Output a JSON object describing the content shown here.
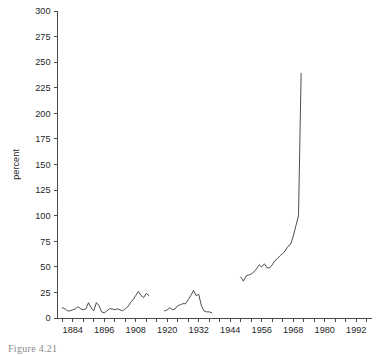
{
  "figure": {
    "caption": "Figure 4.21",
    "ylabel": "percent"
  },
  "chart_data": {
    "type": "line",
    "title": "",
    "xlabel": "",
    "ylabel": "percent",
    "xlim": [
      1878,
      1998
    ],
    "ylim": [
      0,
      300
    ],
    "grid": false,
    "legend": "none",
    "ytick_labels": [
      "0",
      "25",
      "50",
      "75",
      "100",
      "125",
      "150",
      "175",
      "200",
      "225",
      "250",
      "275",
      "300"
    ],
    "ytick_values": [
      0,
      25,
      50,
      75,
      100,
      125,
      150,
      175,
      200,
      225,
      250,
      275,
      300
    ],
    "xtick_labels": [
      "1884",
      "1896",
      "1908",
      "1920",
      "1932",
      "1944",
      "1956",
      "1968",
      "1980",
      "1992"
    ],
    "xtick_values": [
      1884,
      1896,
      1908,
      1920,
      1932,
      1944,
      1956,
      1968,
      1980,
      1992
    ],
    "xminor_step": 4,
    "series": [
      {
        "name": "segment-1",
        "x": [
          1880,
          1881,
          1882,
          1883,
          1884,
          1885,
          1886,
          1887,
          1888,
          1889,
          1890,
          1891,
          1892,
          1893,
          1894,
          1895,
          1896,
          1897,
          1898,
          1899,
          1900,
          1901,
          1902,
          1903,
          1904,
          1905,
          1906,
          1907,
          1908,
          1909,
          1910,
          1911,
          1912,
          1913
        ],
        "values": [
          10,
          9,
          7,
          7,
          8,
          9,
          11,
          9,
          8,
          9,
          15,
          10,
          7,
          15,
          12,
          6,
          5,
          7,
          9,
          9,
          8,
          9,
          8,
          7,
          9,
          11,
          15,
          18,
          22,
          26,
          22,
          20,
          24,
          22
        ]
      },
      {
        "name": "segment-2",
        "x": [
          1919,
          1920,
          1921,
          1922,
          1923,
          1924,
          1925,
          1926,
          1927,
          1928,
          1929,
          1930,
          1931,
          1932,
          1933,
          1934,
          1935,
          1936,
          1937
        ],
        "values": [
          7,
          8,
          10,
          8,
          9,
          12,
          13,
          14,
          14,
          18,
          22,
          27,
          22,
          23,
          12,
          7,
          6,
          6,
          5
        ]
      },
      {
        "name": "segment-3",
        "x": [
          1948,
          1949,
          1950,
          1951,
          1952,
          1953,
          1954,
          1955,
          1956,
          1957,
          1958,
          1959,
          1960,
          1961,
          1962,
          1963,
          1964,
          1965,
          1966,
          1967,
          1968,
          1969,
          1970,
          1971
        ],
        "values": [
          40,
          36,
          41,
          42,
          43,
          45,
          48,
          52,
          50,
          53,
          49,
          49,
          52,
          56,
          58,
          61,
          63,
          66,
          70,
          72,
          80,
          90,
          100,
          239
        ]
      }
    ]
  }
}
